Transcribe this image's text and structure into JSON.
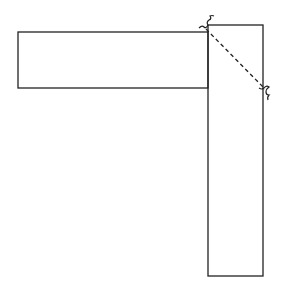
{
  "diagram": {
    "type": "L-shaped joint of two rectangles with diagonal dashed line",
    "stroke_color": "#222222",
    "background": "#ffffff",
    "shapes": {
      "horizontal_rect": {
        "x": 18,
        "y": 32,
        "width": 190,
        "height": 56
      },
      "vertical_rect": {
        "x": 208,
        "y": 25,
        "width": 55,
        "height": 251
      }
    },
    "dashed_line": {
      "x1": 206,
      "y1": 29,
      "x2": 265,
      "y2": 89
    },
    "break_marks": [
      {
        "name": "break-mark-top",
        "x": 206,
        "y": 29
      },
      {
        "name": "break-mark-right",
        "x": 265,
        "y": 89
      }
    ]
  }
}
